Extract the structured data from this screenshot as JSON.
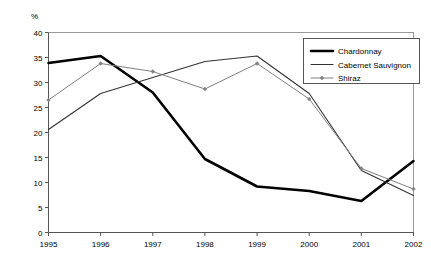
{
  "chart_data": {
    "type": "line",
    "title": "",
    "subtitle": "",
    "xlabel": "",
    "ylabel": "%",
    "unit_label": "%",
    "categories": [
      "1995",
      "1996",
      "1997",
      "1998",
      "1999",
      "2000",
      "2001",
      "2002"
    ],
    "x": [
      1995,
      1996,
      1997,
      1998,
      1999,
      2000,
      2001,
      2002
    ],
    "xlim": [
      1995,
      2002
    ],
    "ylim": [
      0,
      40
    ],
    "yticks": [
      0,
      5,
      10,
      15,
      20,
      25,
      30,
      35,
      40
    ],
    "ytick_labels": [
      "0",
      "5",
      "10",
      "15",
      "20",
      "25",
      "30",
      "35",
      "40"
    ],
    "grid": false,
    "legend_position": "top-right",
    "series": [
      {
        "name": "Chardonnay",
        "values": [
          33.9,
          35.3,
          28.0,
          14.7,
          9.2,
          8.3,
          6.3,
          14.3
        ],
        "color": "#000000",
        "line_width": 2.6,
        "marker": "none"
      },
      {
        "name": "Cabernet Sauvignon",
        "values": [
          20.6,
          27.8,
          31.0,
          34.2,
          35.3,
          27.8,
          12.4,
          7.4
        ],
        "color": "#333333",
        "line_width": 1.1,
        "marker": "none"
      },
      {
        "name": "Shiraz",
        "values": [
          26.5,
          33.8,
          32.2,
          28.7,
          33.8,
          26.7,
          12.8,
          8.7
        ],
        "color": "#808080",
        "line_width": 1.0,
        "marker": "diamond"
      }
    ]
  },
  "legend": {
    "items": [
      {
        "label": "Chardonnay"
      },
      {
        "label": "Cabernet Sauvignon"
      },
      {
        "label": "Shiraz"
      }
    ]
  }
}
